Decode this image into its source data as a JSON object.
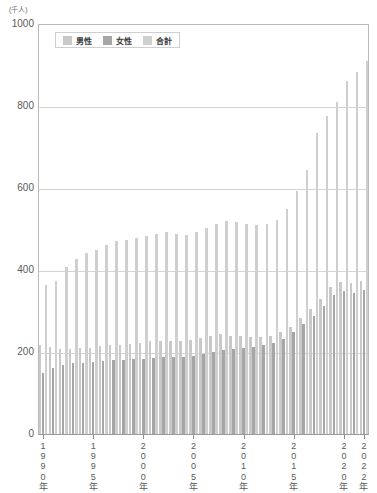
{
  "chart_data": {
    "type": "bar",
    "title": "",
    "subtitle": "",
    "xlabel": "",
    "ylabel": "(千人)",
    "unit_label": "(千人)",
    "ylim": [
      0,
      1000
    ],
    "ytick_values": [
      0,
      200,
      400,
      600,
      800,
      1000
    ],
    "ytick_labels": [
      "0",
      "200",
      "400",
      "600",
      "800",
      "1000"
    ],
    "grid": true,
    "legend_position": "top-left-inside",
    "categories": [
      "1990",
      "1991",
      "1992",
      "1993",
      "1994",
      "1995",
      "1996",
      "1997",
      "1998",
      "1999",
      "2000",
      "2001",
      "2002",
      "2003",
      "2004",
      "2005",
      "2006",
      "2007",
      "2008",
      "2009",
      "2010",
      "2011",
      "2012",
      "2013",
      "2014",
      "2015",
      "2016",
      "2017",
      "2018",
      "2019",
      "2020",
      "2021",
      "2022"
    ],
    "xtick_labels": [
      {
        "index": 0,
        "text": "1\n9\n9\n0\n年"
      },
      {
        "index": 5,
        "text": "1\n9\n9\n5\n年"
      },
      {
        "index": 10,
        "text": "2\n0\n0\n0\n年"
      },
      {
        "index": 15,
        "text": "2\n0\n0\n5\n年"
      },
      {
        "index": 20,
        "text": "2\n0\n1\n0\n年"
      },
      {
        "index": 25,
        "text": "2\n0\n1\n5\n年"
      },
      {
        "index": 30,
        "text": "2\n0\n2\n0\n年"
      },
      {
        "index": 32,
        "text": "2\n0\n2\n2\n年"
      }
    ],
    "series": [
      {
        "name": "男性",
        "color": "#c9c9c9",
        "values": [
          216,
          212,
          208,
          208,
          209,
          210,
          214,
          218,
          218,
          220,
          222,
          226,
          228,
          228,
          228,
          230,
          234,
          240,
          244,
          240,
          238,
          236,
          236,
          240,
          248,
          262,
          282,
          304,
          330,
          358,
          370,
          368,
          372
        ]
      },
      {
        "name": "女性",
        "color": "#a6a6a6",
        "values": [
          148,
          160,
          168,
          172,
          174,
          176,
          178,
          180,
          180,
          182,
          184,
          186,
          188,
          188,
          188,
          190,
          194,
          200,
          206,
          208,
          210,
          212,
          216,
          222,
          232,
          248,
          268,
          288,
          312,
          338,
          348,
          344,
          352
        ]
      },
      {
        "name": "合計",
        "color": "#cfcfcf",
        "values": [
          364,
          372,
          408,
          428,
          442,
          448,
          462,
          470,
          472,
          478,
          482,
          488,
          492,
          488,
          486,
          492,
          502,
          512,
          520,
          516,
          512,
          510,
          512,
          522,
          548,
          592,
          644,
          734,
          776,
          810,
          862,
          882,
          910
        ]
      }
    ]
  },
  "legend": {
    "items": [
      {
        "label": "男性",
        "color": "#c9c9c9"
      },
      {
        "label": "女性",
        "color": "#a6a6a6"
      },
      {
        "label": "合計",
        "color": "#cfcfcf"
      }
    ]
  }
}
